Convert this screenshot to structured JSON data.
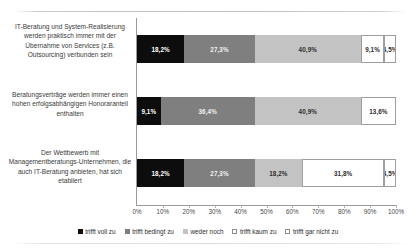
{
  "chart_data": {
    "type": "bar",
    "orientation": "horizontal",
    "stacked": true,
    "normalized_percent": true,
    "title": "",
    "xlabel": "",
    "ylabel": "",
    "xlim": [
      0,
      100
    ],
    "xticks": [
      "0%",
      "10%",
      "20%",
      "30%",
      "40%",
      "50%",
      "60%",
      "70%",
      "80%",
      "90%",
      "100%"
    ],
    "grid": false,
    "legend_position": "bottom",
    "categories": [
      "IT-Beratung und System-Realisierung werden praktisch immer mit der Übernahme von Services (z.B. Outsourcing) verbunden sein",
      "Beratungsverträge werden immer einen hohen erfolgsabhängigen Honoraranteil enthalten",
      "Der Wettbewerb mit Managementberatungs-Unternehmen, die auch IT-Beratung anbieten, hat sich etabliert"
    ],
    "series": [
      {
        "name": "trifft voll zu",
        "color": "#0d0d0d",
        "values": [
          18.2,
          9.1,
          18.2
        ],
        "labels": [
          "18,2%",
          "9,1%",
          "18,2%"
        ]
      },
      {
        "name": "trifft bedingt zu",
        "color": "#7f7f7f",
        "values": [
          27.3,
          36.4,
          27.3
        ],
        "labels": [
          "27,3%",
          "36,4%",
          "27,3%"
        ]
      },
      {
        "name": "weder noch",
        "color": "#c3c3c3",
        "values": [
          40.9,
          40.9,
          18.2
        ],
        "labels": [
          "40,9%",
          "40,9%",
          "18,2%"
        ]
      },
      {
        "name": "trifft kaum zu",
        "color": "#ffffff",
        "values": [
          9.1,
          13.6,
          31.8
        ],
        "labels": [
          "9,1%",
          "13,6%",
          "31,8%"
        ]
      },
      {
        "name": "trifft gar nicht zu",
        "color": "#ffffff",
        "values": [
          4.5,
          0,
          4.5
        ],
        "labels": [
          "4,5%",
          "",
          "4,5%"
        ]
      }
    ]
  },
  "legend": {
    "items": [
      {
        "label": "trifft voll zu"
      },
      {
        "label": "trifft bedingt zu"
      },
      {
        "label": "weder noch"
      },
      {
        "label": "trifft kaum zu"
      },
      {
        "label": "trifft gar nicht zu"
      }
    ]
  }
}
